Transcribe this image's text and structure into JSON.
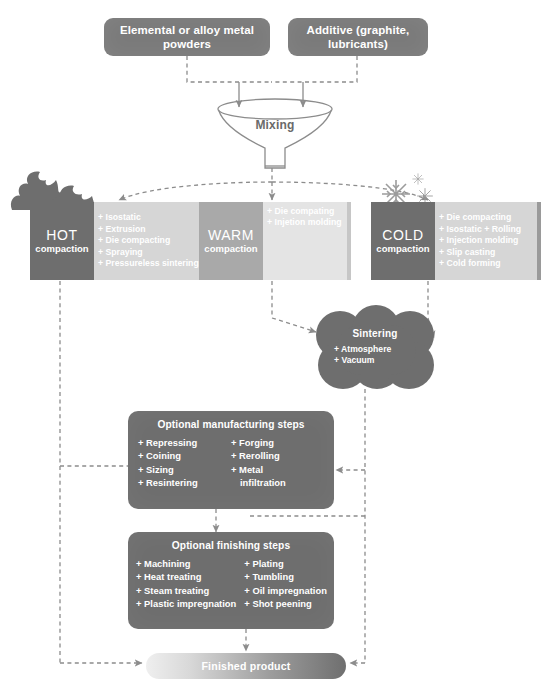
{
  "diagram": {
    "colors": {
      "dark_block": "#6e6e6e",
      "light_block": "#a9a9a9",
      "list_bg": "#d6d6d6",
      "warm_list_bg": "#e4e4e4",
      "text_on_dark": "#ffffff",
      "wire": "#8c8c8c"
    }
  },
  "inputs": [
    {
      "id": "metal-powders",
      "label": "Elemental or alloy metal powders"
    },
    {
      "id": "additive",
      "label": "Additive (graphite, lubricants)"
    }
  ],
  "mixing": {
    "label": "Mixing"
  },
  "compaction": [
    {
      "id": "hot",
      "name": "HOT",
      "sub": "compaction",
      "decoration": "flame-icon",
      "items": [
        "Isostatic",
        "Extrusion",
        "Die compacting",
        "Spraying",
        "Pressureless sintering"
      ]
    },
    {
      "id": "warm",
      "name": "WARM",
      "sub": "compaction",
      "decoration": "none",
      "items": [
        "Die compating",
        "Injetion molding"
      ]
    },
    {
      "id": "cold",
      "name": "COLD",
      "sub": "compaction",
      "decoration": "snowflake-icon",
      "items": [
        "Die compacting",
        "Isostatic + Rolling",
        "Injection molding",
        "Slip casting",
        "Cold forming"
      ]
    }
  ],
  "sintering": {
    "title": "Sintering",
    "items": [
      "Atmosphere",
      "Vacuum"
    ]
  },
  "manufacturing": {
    "title": "Optional manufacturing steps",
    "col_left": [
      "Repressing",
      "Coining",
      "Sizing",
      "Resintering"
    ],
    "col_right": [
      "Forging",
      "Rerolling",
      "Metal",
      "infiltration"
    ]
  },
  "finishing": {
    "title": "Optional finishing steps",
    "col_left": [
      "Machining",
      "Heat treating",
      "Steam treating",
      "Plastic impregnation"
    ],
    "col_right": [
      "Plating",
      "Tumbling",
      "Oil impregnation",
      "Shot peening"
    ]
  },
  "finished_product": {
    "label": "Finished product"
  },
  "plus_glyph": "+"
}
